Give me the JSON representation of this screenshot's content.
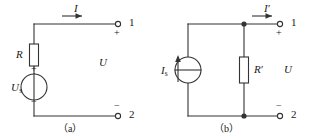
{
  "figure": {
    "line_color": "#333333",
    "text_color": "#1a1a1a",
    "background": "#ffffff"
  },
  "circuit_a": {
    "caption": "（a）",
    "current_label": "I",
    "current_arrow": "arrow-right",
    "resistor_label": "R",
    "source_label": "U",
    "source_subscript": "s",
    "source_plus": "+",
    "source_minus": "−",
    "voltage_label": "U",
    "terminal_top": {
      "number": "1",
      "polarity": "+"
    },
    "terminal_bottom": {
      "number": "2",
      "polarity": "−"
    }
  },
  "circuit_b": {
    "caption": "（b）",
    "current_label": "I",
    "current_prime": "′",
    "current_arrow": "arrow-right",
    "source_label": "I",
    "source_subscript": "s",
    "source_arrow": "arrow-up",
    "resistor_label": "R",
    "resistor_prime": "′",
    "voltage_label": "U",
    "terminal_top": {
      "number": "1",
      "polarity": "+"
    },
    "terminal_bottom": {
      "number": "2",
      "polarity": "−"
    }
  }
}
